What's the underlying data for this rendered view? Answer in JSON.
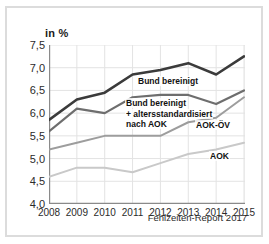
{
  "figure": {
    "axis_unit_label": "in %",
    "source_note": "Fehlzeiten-Report 2017",
    "frame_color": "#dcdcdc",
    "background_color": "#ffffff",
    "gridline_color": "#e3e3e3",
    "axis_color": "#8a8a8a"
  },
  "labels": {
    "bund": "Bund bereinigt",
    "bund_std_line1": "Bund bereinigt",
    "bund_std_line2": "+ altersstandardisiert",
    "bund_std_line3": "nach AOK",
    "aok_oev": "AOK-ÖV",
    "aok": "AOK"
  },
  "chart_data": {
    "type": "line",
    "title": "",
    "subtitle": "",
    "xlabel": "",
    "ylabel": "in %",
    "ylim": [
      4.0,
      7.5
    ],
    "yticks": [
      "4,0",
      "4,5",
      "5,0",
      "5,5",
      "6,0",
      "6,5",
      "7,0",
      "7,5"
    ],
    "ytick_values": [
      4.0,
      4.5,
      5.0,
      5.5,
      6.0,
      6.5,
      7.0,
      7.5
    ],
    "grid": true,
    "legend_position": "inline-annotations",
    "categories": [
      "2008",
      "2009",
      "2010",
      "2011",
      "2012",
      "2013",
      "2014",
      "2015"
    ],
    "x": [
      2008,
      2009,
      2010,
      2011,
      2012,
      2013,
      2014,
      2015
    ],
    "series": [
      {
        "name": "Bund bereinigt",
        "color": "#3b3b3b",
        "width": 2.6,
        "values": [
          5.85,
          6.3,
          6.45,
          6.85,
          6.95,
          7.1,
          6.85,
          7.25
        ]
      },
      {
        "name": "Bund bereinigt + altersstandardisiert nach AOK",
        "color": "#6e6e6e",
        "width": 2.2,
        "values": [
          5.6,
          6.1,
          6.0,
          6.35,
          6.4,
          6.4,
          6.2,
          6.5
        ]
      },
      {
        "name": "AOK-ÖV",
        "color": "#9d9d9d",
        "width": 2.0,
        "values": [
          5.2,
          5.35,
          5.5,
          5.5,
          5.5,
          5.8,
          5.9,
          6.35
        ]
      },
      {
        "name": "AOK",
        "color": "#c9c9c9",
        "width": 2.0,
        "values": [
          4.6,
          4.8,
          4.8,
          4.7,
          4.9,
          5.1,
          5.2,
          5.35
        ]
      }
    ]
  }
}
